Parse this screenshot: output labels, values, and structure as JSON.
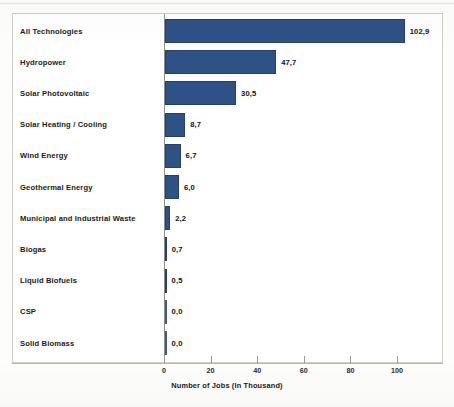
{
  "chart_data": {
    "type": "bar",
    "orientation": "horizontal",
    "title": "",
    "xlabel": "Number of Jobs (In Thousand)",
    "ylabel": "",
    "xlim": [
      0,
      115
    ],
    "grid": false,
    "legend": null,
    "decimal_separator": ",",
    "bar_color": "#2e5186",
    "categories": [
      "All Technologies",
      "Hydropower",
      "Solar Photovoltaic",
      "Solar Heating / Cooling",
      "Wind Energy",
      "Geothermal Energy",
      "Municipal and Industrial Waste",
      "Biogas",
      "Liquid Biofuels",
      "CSP",
      "Solid Biomass"
    ],
    "values": [
      102.9,
      47.7,
      30.5,
      8.7,
      6.7,
      6.0,
      2.2,
      0.7,
      0.5,
      0.0,
      0.0
    ],
    "value_labels": [
      "102,9",
      "47,7",
      "30,5",
      "8,7",
      "6,7",
      "6,0",
      "2,2",
      "0,7",
      "0,5",
      "0,0",
      "0,0"
    ],
    "xticks": [
      0,
      20,
      40,
      60,
      80,
      100
    ],
    "xtick_labels": [
      "0",
      "20",
      "40",
      "60",
      "80",
      "100"
    ]
  }
}
